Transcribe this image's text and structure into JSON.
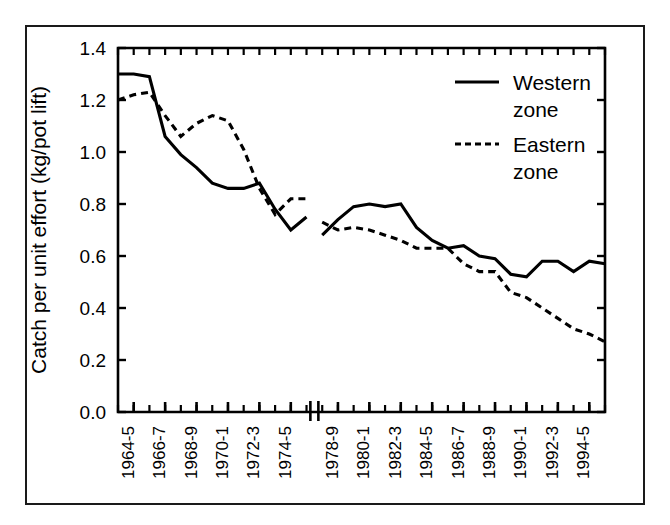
{
  "figure": {
    "border_color": "#1a1a1a",
    "background": "#ffffff"
  },
  "chart_data": {
    "type": "line",
    "title": "",
    "xlabel": "",
    "ylabel": "Catch per unit effort (kg/pot lift)",
    "ylim": [
      0.0,
      1.4
    ],
    "ytick_labels": [
      "0.0",
      "0.2",
      "0.4",
      "0.6",
      "0.8",
      "1.0",
      "1.2",
      "1.4"
    ],
    "ytick_values": [
      0.0,
      0.2,
      0.4,
      0.6,
      0.8,
      1.0,
      1.2,
      1.4
    ],
    "grid": false,
    "legend_position": "top-right",
    "axis_break_after_category": "1975-6",
    "axis_break_label": "||",
    "categories": [
      "1963-4",
      "1964-5",
      "1965-6",
      "1966-7",
      "1967-8",
      "1968-9",
      "1969-70",
      "1970-1",
      "1971-2",
      "1972-3",
      "1973-4",
      "1974-5",
      "1975-6",
      "1977-8",
      "1978-9",
      "1979-80",
      "1980-1",
      "1981-2",
      "1982-3",
      "1983-4",
      "1984-5",
      "1985-6",
      "1986-7",
      "1987-8",
      "1988-9",
      "1989-90",
      "1990-1",
      "1991-2",
      "1992-3",
      "1993-4",
      "1994-5",
      "1995-6"
    ],
    "xtick_labels": [
      "1964-5",
      "1966-7",
      "1968-9",
      "1970-1",
      "1972-3",
      "1974-5",
      "1978-9",
      "1980-1",
      "1982-3",
      "1984-5",
      "1986-7",
      "1988-9",
      "1990-1",
      "1992-3",
      "1994-5"
    ],
    "series": [
      {
        "name": "Western zone",
        "style": "solid",
        "color": "#000000",
        "values": [
          1.3,
          1.3,
          1.29,
          1.06,
          0.99,
          0.94,
          0.88,
          0.86,
          0.86,
          0.88,
          0.78,
          0.7,
          0.75,
          0.68,
          0.74,
          0.79,
          0.8,
          0.79,
          0.8,
          0.71,
          0.66,
          0.63,
          0.64,
          0.6,
          0.59,
          0.53,
          0.52,
          0.58,
          0.58,
          0.54,
          0.58,
          0.57
        ]
      },
      {
        "name": "Eastern zone",
        "style": "dashed",
        "color": "#000000",
        "values": [
          1.2,
          1.22,
          1.23,
          1.14,
          1.06,
          1.11,
          1.14,
          1.12,
          1.01,
          0.86,
          0.76,
          0.82,
          0.82,
          0.73,
          0.7,
          0.71,
          0.7,
          0.68,
          0.66,
          0.63,
          0.63,
          0.63,
          0.57,
          0.54,
          0.54,
          0.46,
          0.44,
          0.4,
          0.36,
          0.32,
          0.3,
          0.27
        ]
      }
    ]
  },
  "legend": {
    "items": [
      {
        "label_line1": "Western",
        "label_line2": "zone",
        "style": "solid"
      },
      {
        "label_line1": "Eastern",
        "label_line2": "zone",
        "style": "dashed"
      }
    ]
  }
}
